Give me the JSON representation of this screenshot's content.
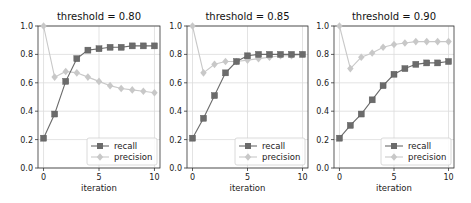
{
  "chart_data": [
    {
      "type": "line",
      "title": "threshold = 0.80",
      "xlabel": "iteration",
      "ylabel": "",
      "x": [
        0,
        1,
        2,
        3,
        4,
        5,
        6,
        7,
        8,
        9,
        10
      ],
      "xticks": [
        0,
        5,
        10
      ],
      "yticks": [
        0.0,
        0.2,
        0.4,
        0.6,
        0.8,
        1.0
      ],
      "ylim": [
        0,
        1
      ],
      "xlim": [
        -0.5,
        10.5
      ],
      "grid": true,
      "legend_position": "lower right",
      "series": [
        {
          "name": "recall",
          "marker": "square",
          "color": "#6b6b6b",
          "values": [
            0.21,
            0.38,
            0.61,
            0.77,
            0.83,
            0.84,
            0.85,
            0.85,
            0.86,
            0.86,
            0.86
          ]
        },
        {
          "name": "precision",
          "marker": "diamond",
          "color": "#c8c8c8",
          "values": [
            1.0,
            0.64,
            0.68,
            0.67,
            0.64,
            0.61,
            0.58,
            0.56,
            0.55,
            0.54,
            0.53
          ]
        }
      ]
    },
    {
      "type": "line",
      "title": "threshold = 0.85",
      "xlabel": "iteration",
      "ylabel": "",
      "x": [
        0,
        1,
        2,
        3,
        4,
        5,
        6,
        7,
        8,
        9,
        10
      ],
      "xticks": [
        0,
        5,
        10
      ],
      "yticks": [
        0.0,
        0.2,
        0.4,
        0.6,
        0.8,
        1.0
      ],
      "ylim": [
        0,
        1
      ],
      "xlim": [
        -0.5,
        10.5
      ],
      "grid": true,
      "legend_position": "lower right",
      "series": [
        {
          "name": "recall",
          "marker": "square",
          "color": "#6b6b6b",
          "values": [
            0.21,
            0.35,
            0.51,
            0.67,
            0.75,
            0.79,
            0.8,
            0.8,
            0.8,
            0.8,
            0.8
          ]
        },
        {
          "name": "precision",
          "marker": "diamond",
          "color": "#c8c8c8",
          "values": [
            1.0,
            0.67,
            0.73,
            0.75,
            0.75,
            0.76,
            0.77,
            0.78,
            0.79,
            0.79,
            0.8
          ]
        }
      ]
    },
    {
      "type": "line",
      "title": "threshold = 0.90",
      "xlabel": "iteration",
      "ylabel": "",
      "x": [
        0,
        1,
        2,
        3,
        4,
        5,
        6,
        7,
        8,
        9,
        10
      ],
      "xticks": [
        0,
        5,
        10
      ],
      "yticks": [
        0.0,
        0.2,
        0.4,
        0.6,
        0.8,
        1.0
      ],
      "ylim": [
        0,
        1
      ],
      "xlim": [
        -0.5,
        10.5
      ],
      "grid": true,
      "legend_position": "lower right",
      "series": [
        {
          "name": "recall",
          "marker": "square",
          "color": "#6b6b6b",
          "values": [
            0.21,
            0.3,
            0.38,
            0.48,
            0.58,
            0.66,
            0.7,
            0.73,
            0.74,
            0.74,
            0.75
          ]
        },
        {
          "name": "precision",
          "marker": "diamond",
          "color": "#c8c8c8",
          "values": [
            1.0,
            0.7,
            0.78,
            0.81,
            0.85,
            0.87,
            0.88,
            0.89,
            0.89,
            0.89,
            0.89
          ]
        }
      ]
    }
  ],
  "panels": [
    {
      "title": "threshold = 0.80",
      "xlabel": "iteration",
      "legend": [
        "recall",
        "precision"
      ]
    },
    {
      "title": "threshold = 0.85",
      "xlabel": "iteration",
      "legend": [
        "recall",
        "precision"
      ]
    },
    {
      "title": "threshold = 0.90",
      "xlabel": "iteration",
      "legend": [
        "recall",
        "precision"
      ]
    }
  ]
}
